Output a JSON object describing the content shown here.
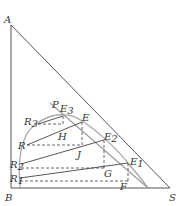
{
  "diagram": {
    "title": "",
    "colors": {
      "triangle": "#555555",
      "binodal_curve": "#a8a8a8",
      "tie_lines": "#444444",
      "dashed": "#555555",
      "operating_line": "#9a9a9a",
      "label": "#333333"
    },
    "vertices": [
      {
        "id": "A",
        "label": "A",
        "x": 11,
        "y": 25,
        "lx": 4,
        "ly": 23
      },
      {
        "id": "B",
        "label": "B",
        "x": 11,
        "y": 188,
        "lx": 5,
        "ly": 201
      },
      {
        "id": "S",
        "label": "S",
        "x": 170,
        "y": 188,
        "lx": 169,
        "ly": 201
      }
    ],
    "points": [
      {
        "id": "P",
        "label": "P",
        "sub": "",
        "x": 52,
        "y": 107,
        "lx": 52,
        "ly": 108
      },
      {
        "id": "E3",
        "label": "E",
        "sub": "3",
        "x": 63,
        "y": 116,
        "lx": 60,
        "ly": 112
      },
      {
        "id": "E",
        "label": "E",
        "sub": "",
        "x": 82,
        "y": 122,
        "lx": 82,
        "ly": 121
      },
      {
        "id": "R3",
        "label": "R",
        "sub": "3",
        "x": 38,
        "y": 124,
        "lx": 24,
        "ly": 125
      },
      {
        "id": "H",
        "label": "H",
        "sub": "",
        "x": 62,
        "y": 126,
        "lx": 58,
        "ly": 140
      },
      {
        "id": "E2",
        "label": "E",
        "sub": "2",
        "x": 104,
        "y": 140,
        "lx": 104,
        "ly": 140
      },
      {
        "id": "R",
        "label": "R",
        "sub": "",
        "x": 27,
        "y": 145,
        "lx": 18,
        "ly": 149
      },
      {
        "id": "J",
        "label": "J",
        "sub": "",
        "x": 82,
        "y": 145,
        "lx": 77,
        "ly": 158
      },
      {
        "id": "E1",
        "label": "E",
        "sub": "1",
        "x": 128,
        "y": 163,
        "lx": 130,
        "ly": 165
      },
      {
        "id": "R2",
        "label": "R",
        "sub": "2",
        "x": 21,
        "y": 164,
        "lx": 10,
        "ly": 168
      },
      {
        "id": "G",
        "label": "G",
        "sub": "",
        "x": 104,
        "y": 168,
        "lx": 104,
        "ly": 177
      },
      {
        "id": "R1",
        "label": "R",
        "sub": "1",
        "x": 20,
        "y": 178,
        "lx": 10,
        "ly": 182
      },
      {
        "id": "F",
        "label": "F",
        "sub": "",
        "x": 128,
        "y": 181,
        "lx": 120,
        "ly": 190
      }
    ],
    "binodal_curve_path": "M20,188 C18,160 20,135 36,124 C48,115 66,110 82,121 C98,131 118,150 128,163 C138,175 144,182 148,188",
    "tie_lines": [
      {
        "from": "R3",
        "to": "E3"
      },
      {
        "from": "R",
        "to": "E"
      },
      {
        "from": "R2",
        "to": "E2"
      },
      {
        "from": "R1",
        "to": "E1"
      }
    ],
    "dashed_lines": [
      {
        "x1": 38,
        "y1": 124,
        "x2": 63,
        "y2": 124
      },
      {
        "x1": 63,
        "y1": 116,
        "x2": 63,
        "y2": 124
      },
      {
        "x1": 27,
        "y1": 145,
        "x2": 82,
        "y2": 145
      },
      {
        "x1": 82,
        "y1": 122,
        "x2": 82,
        "y2": 145
      },
      {
        "x1": 21,
        "y1": 168,
        "x2": 104,
        "y2": 168
      },
      {
        "x1": 104,
        "y1": 140,
        "x2": 104,
        "y2": 168
      },
      {
        "x1": 20,
        "y1": 181,
        "x2": 128,
        "y2": 181
      },
      {
        "x1": 128,
        "y1": 163,
        "x2": 128,
        "y2": 181
      }
    ],
    "operating_line": {
      "x1": 50,
      "y1": 103,
      "x2": 148,
      "y2": 188
    }
  }
}
